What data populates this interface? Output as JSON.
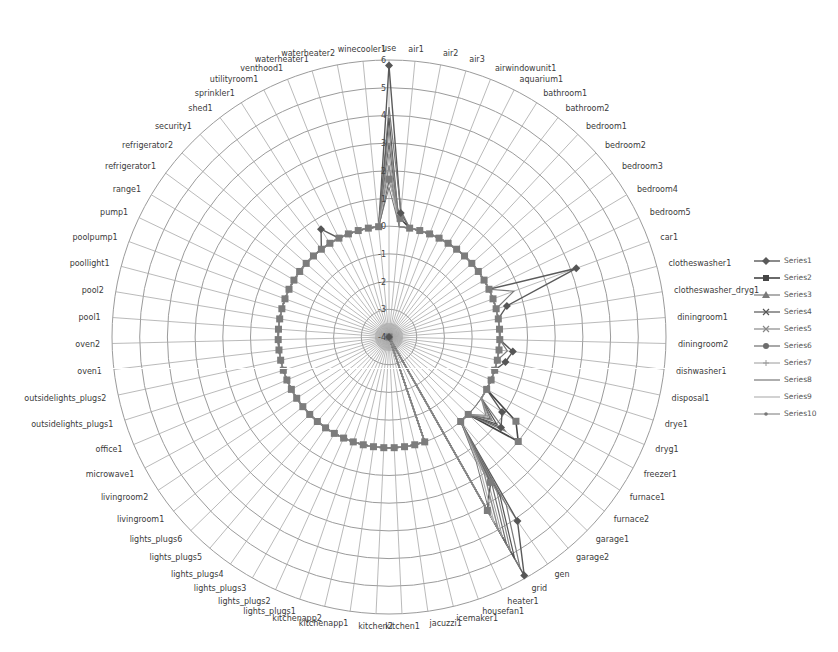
{
  "chart_data": {
    "type": "radar",
    "title": "",
    "axis": {
      "min": -4,
      "max": 6,
      "step": 1,
      "tick_labels": [
        "-4",
        "-3",
        "-2",
        "-1",
        "0",
        "1",
        "2",
        "3",
        "4",
        "5",
        "6"
      ]
    },
    "grid": true,
    "legend_position": "right",
    "categories": [
      "use",
      "air1",
      "air2",
      "air3",
      "airwindowunit1",
      "aquarium1",
      "bathroom1",
      "bathroom2",
      "bedroom1",
      "bedroom2",
      "bedroom3",
      "bedroom4",
      "bedroom5",
      "car1",
      "clotheswasher1",
      "clotheswasher_dryg1",
      "diningroom1",
      "diningroom2",
      "dishwasher1",
      "disposal1",
      "drye1",
      "dryg1",
      "freezer1",
      "furnace1",
      "furnace2",
      "garage1",
      "garage2",
      "gen",
      "grid",
      "heater1",
      "housefan1",
      "icemaker1",
      "jacuzzi1",
      "kitchen1",
      "kitchen2",
      "kitchenapp1",
      "kitchenapp2",
      "lights_plugs1",
      "lights_plugs2",
      "lights_plugs3",
      "lights_plugs4",
      "lights_plugs5",
      "lights_plugs6",
      "livingroom1",
      "livingroom2",
      "microwave1",
      "office1",
      "outsidelights_plugs1",
      "outsidelights_plugs2",
      "oven1",
      "oven2",
      "pool1",
      "pool2",
      "poollight1",
      "poolpump1",
      "pump1",
      "range1",
      "refrigerator1",
      "refrigerator2",
      "security1",
      "shed1",
      "sprinkler1",
      "utilityroom1",
      "venthood1",
      "waterheater1",
      "waterheater2",
      "winecooler1"
    ],
    "series": [
      {
        "name": "Series1",
        "color": "#5a5a5a",
        "marker": "diamond",
        "width": 1.4,
        "values": {
          "use": 5.8,
          "air1": 0.5,
          "car1": 3.2,
          "clotheswasher1": 0.4,
          "dishwasher1": 0.5,
          "disposal1": 0.3,
          "furnace1": 0.9,
          "furnace2": 1.2,
          "gen": 4.1,
          "grid": 5.9,
          "heater1": -4,
          "sprinkler1": 0.6
        }
      },
      {
        "name": "Series2",
        "color": "#454545",
        "marker": "square",
        "width": 1.6,
        "values": {
          "use": 1.7,
          "air1": 0.3,
          "furnace1": 1.5,
          "furnace2": 2.0,
          "gen": 2.4,
          "grid": 3.2,
          "heater1": -4
        }
      },
      {
        "name": "Series3",
        "color": "#7a7a7a",
        "marker": "triangle",
        "width": 1.2,
        "values": {
          "use": 4.3,
          "air1": 0.6,
          "car1": 0.8,
          "furnace2": 1.4,
          "gen": 3.4,
          "grid": 5.6,
          "heater1": -4,
          "dishwasher1": 0.3
        }
      },
      {
        "name": "Series4",
        "color": "#555555",
        "marker": "x",
        "width": 1.2,
        "values": {
          "use": 3.9,
          "furnace2": 1.0,
          "gen": 3.0,
          "grid": 5.2,
          "heater1": -4
        }
      },
      {
        "name": "Series5",
        "color": "#888888",
        "marker": "x",
        "width": 1.2,
        "values": {
          "use": 3.5,
          "furnace2": 0.8,
          "gen": 2.8,
          "grid": 4.9,
          "heater1": -4
        }
      },
      {
        "name": "Series6",
        "color": "#6d6d6d",
        "marker": "circle",
        "width": 1.2,
        "values": {
          "use": 3.0,
          "furnace2": 0.7,
          "gen": 2.5,
          "grid": 4.6,
          "heater1": -4
        }
      },
      {
        "name": "Series7",
        "color": "#9a9a9a",
        "marker": "plus",
        "width": 1.0,
        "values": {
          "use": 2.6,
          "furnace2": 0.6,
          "gen": 2.2,
          "grid": 4.3,
          "heater1": -4
        }
      },
      {
        "name": "Series8",
        "color": "#8c8c8c",
        "marker": "none",
        "width": 1.4,
        "values": {
          "use": 2.2,
          "furnace2": 0.5,
          "gen": 2.0,
          "grid": 4.0,
          "heater1": -4
        }
      },
      {
        "name": "Series9",
        "color": "#b4b4b4",
        "marker": "none",
        "width": 1.2,
        "values": {
          "use": 1.8,
          "gen": 1.7,
          "grid": 3.7,
          "heater1": -4
        }
      },
      {
        "name": "Series10",
        "color": "#777777",
        "marker": "dot",
        "width": 1.0,
        "values": {
          "use": 1.4,
          "gen": 1.5,
          "grid": 3.4,
          "heater1": -4
        }
      }
    ],
    "default_value": 0,
    "baseline_marker_series": "Series2"
  }
}
